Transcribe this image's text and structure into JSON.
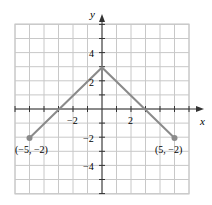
{
  "chart_data": {
    "type": "line",
    "title": "",
    "xlabel": "x",
    "ylabel": "y",
    "xlim": [
      -6,
      6
    ],
    "ylim": [
      -6,
      6
    ],
    "grid": true,
    "x": [
      -5,
      0,
      5
    ],
    "series": [
      {
        "name": "graph",
        "values": [
          -2,
          3,
          -2
        ]
      }
    ],
    "x_tick_labels": [
      "-2",
      "2"
    ],
    "y_tick_labels": [
      "4",
      "2",
      "-2",
      "-4"
    ],
    "annotations": [
      {
        "text": "(−5, −2)",
        "x": -5,
        "y": -2
      },
      {
        "text": "(5, −2)",
        "x": 5,
        "y": -2
      }
    ]
  },
  "labels": {
    "x_axis": "x",
    "y_axis": "y",
    "xt_neg2": "−2",
    "xt_2": "2",
    "yt_4": "4",
    "yt_2": "2",
    "yt_neg2": "−2",
    "yt_neg4": "−4",
    "pt_left": "(−5, −2)",
    "pt_right": "(5, −2)"
  }
}
